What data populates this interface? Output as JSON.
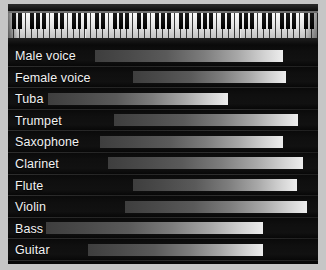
{
  "chart_data": {
    "type": "bar",
    "title": "",
    "subtitle": "",
    "xlabel": "",
    "ylabel": "",
    "grid": false,
    "legend": "none",
    "orientation": "horizontal",
    "x_axis_note": "piano keyboard (88 keys) spanning full panel width; bars are pitch/frequency ranges aligned to the keyboard",
    "x_units": "keyboard position (fraction of panel width, 0 = lowest key, 100 = highest key)",
    "categories": [
      "Male voice",
      "Female voice",
      "Tuba",
      "Trumpet",
      "Saxophone",
      "Clarinet",
      "Flute",
      "Violin",
      "Bass",
      "Guitar"
    ],
    "series": [
      {
        "name": "range_start",
        "values": [
          28.1,
          40.3,
          12.9,
          34.2,
          29.7,
          32.3,
          40.3,
          37.7,
          12.3,
          25.8
        ]
      },
      {
        "name": "range_end",
        "values": [
          88.7,
          89.7,
          71.0,
          93.5,
          88.7,
          95.2,
          93.2,
          96.5,
          82.3,
          82.3
        ]
      }
    ],
    "bars": [
      {
        "label": "Male voice",
        "start": 28.1,
        "end": 88.7
      },
      {
        "label": "Female voice",
        "start": 40.3,
        "end": 89.7
      },
      {
        "label": "Tuba",
        "start": 12.9,
        "end": 71.0
      },
      {
        "label": "Trumpet",
        "start": 34.2,
        "end": 93.5
      },
      {
        "label": "Saxophone",
        "start": 29.7,
        "end": 88.7
      },
      {
        "label": "Clarinet",
        "start": 32.3,
        "end": 95.2
      },
      {
        "label": "Flute",
        "start": 40.3,
        "end": 93.2
      },
      {
        "label": "Violin",
        "start": 37.7,
        "end": 96.5
      },
      {
        "label": "Bass",
        "start": 12.3,
        "end": 82.3
      },
      {
        "label": "Guitar",
        "start": 25.8,
        "end": 82.3
      }
    ],
    "xlim": [
      0,
      100
    ],
    "colors": {
      "panel_background": "#080808",
      "figure_background": "#c6c6c6",
      "label_text": "#f2f2f2",
      "bar_gradient_start": "#3e3e3e",
      "bar_gradient_end": "#ededed",
      "row_separator": "#3a3a3a",
      "white_key": "#f2f2f2",
      "black_key": "#0a0a0a"
    }
  },
  "keyboard": {
    "name": "piano-keyboard",
    "total_white_keys": 52,
    "octave_black_key_pattern": [
      1,
      1,
      0,
      1,
      1,
      1,
      0
    ]
  }
}
